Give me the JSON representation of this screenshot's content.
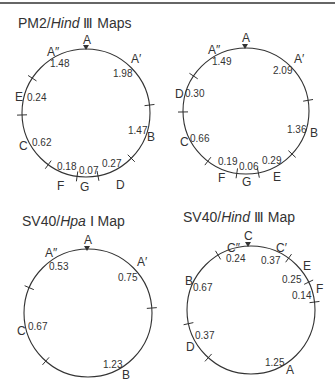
{
  "maps": [
    {
      "id": "pm2-hind3-1",
      "title_prefix": "PM2/",
      "title_enzyme": "Hind",
      "title_suffix": " Ⅲ  Maps",
      "title_pos": [
        18,
        28
      ],
      "circle": {
        "cx": 86,
        "cy": 113,
        "r": 64
      },
      "origin_marker": [
        86,
        49
      ],
      "ticks": [
        [
          32,
          78
        ],
        [
          21,
          115
        ],
        [
          150,
          105
        ],
        [
          131,
          158
        ],
        [
          48,
          165
        ],
        [
          77,
          177
        ],
        [
          98,
          176
        ]
      ],
      "fragments": [
        {
          "name": "A",
          "x": 83,
          "y": 44
        },
        {
          "name": "A″",
          "x": 47,
          "y": 56
        },
        {
          "name": "A′",
          "x": 131,
          "y": 63
        },
        {
          "name": "E",
          "x": 15,
          "y": 101
        },
        {
          "name": "C",
          "x": 19,
          "y": 150
        },
        {
          "name": "F",
          "x": 57,
          "y": 190
        },
        {
          "name": "G",
          "x": 80,
          "y": 191
        },
        {
          "name": "D",
          "x": 116,
          "y": 189
        },
        {
          "name": "B",
          "x": 147,
          "y": 141
        }
      ],
      "lengths": [
        {
          "value": "1.48",
          "x": 50,
          "y": 67
        },
        {
          "value": "1.98",
          "x": 113,
          "y": 77
        },
        {
          "value": "0.24",
          "x": 27,
          "y": 101
        },
        {
          "value": "0.62",
          "x": 32,
          "y": 146
        },
        {
          "value": "0.18",
          "x": 57,
          "y": 170
        },
        {
          "value": "0.07",
          "x": 79,
          "y": 174
        },
        {
          "value": "0.27",
          "x": 102,
          "y": 167
        },
        {
          "value": "1.47",
          "x": 128,
          "y": 134
        }
      ]
    },
    {
      "id": "pm2-hind3-2",
      "circle": {
        "cx": 246,
        "cy": 111,
        "r": 63
      },
      "origin_marker": [
        245,
        48
      ],
      "ticks": [
        [
          192,
          75
        ],
        [
          181,
          112
        ],
        [
          310,
          100
        ],
        [
          292,
          154
        ],
        [
          208,
          161
        ],
        [
          237,
          172
        ],
        [
          258,
          171
        ]
      ],
      "fragments": [
        {
          "name": "A",
          "x": 242,
          "y": 42
        },
        {
          "name": "A″",
          "x": 208,
          "y": 54
        },
        {
          "name": "A′",
          "x": 294,
          "y": 63
        },
        {
          "name": "D",
          "x": 175,
          "y": 98
        },
        {
          "name": "C",
          "x": 180,
          "y": 146
        },
        {
          "name": "F",
          "x": 218,
          "y": 182
        },
        {
          "name": "G",
          "x": 242,
          "y": 186
        },
        {
          "name": "E",
          "x": 273,
          "y": 181
        },
        {
          "name": "B",
          "x": 310,
          "y": 137
        }
      ],
      "lengths": [
        {
          "value": "1.49",
          "x": 212,
          "y": 65
        },
        {
          "value": "2.09",
          "x": 273,
          "y": 74
        },
        {
          "value": "0.30",
          "x": 185,
          "y": 97
        },
        {
          "value": "0.66",
          "x": 190,
          "y": 142
        },
        {
          "value": "0.19",
          "x": 218,
          "y": 165
        },
        {
          "value": "0.06",
          "x": 239,
          "y": 170
        },
        {
          "value": "0.29",
          "x": 262,
          "y": 164
        },
        {
          "value": "1.36",
          "x": 287,
          "y": 133
        }
      ]
    },
    {
      "id": "sv40-hpa1",
      "title_prefix": "SV40/",
      "title_enzyme": "Hpa",
      "title_suffix": " Ⅰ  Map",
      "title_pos": [
        22,
        226
      ],
      "circle": {
        "cx": 88,
        "cy": 313,
        "r": 64
      },
      "origin_marker": [
        87,
        250
      ],
      "ticks": [
        [
          30,
          288
        ],
        [
          152,
          308
        ],
        [
          45,
          362
        ]
      ],
      "fragments": [
        {
          "name": "A",
          "x": 84,
          "y": 244
        },
        {
          "name": "A″",
          "x": 45,
          "y": 257
        },
        {
          "name": "A′",
          "x": 137,
          "y": 266
        },
        {
          "name": "C",
          "x": 17,
          "y": 335
        },
        {
          "name": "B",
          "x": 122,
          "y": 379
        }
      ],
      "lengths": [
        {
          "value": "0.53",
          "x": 49,
          "y": 270
        },
        {
          "value": "0.75",
          "x": 118,
          "y": 281
        },
        {
          "value": "0.67",
          "x": 28,
          "y": 330
        },
        {
          "value": "1.23",
          "x": 103,
          "y": 368
        }
      ]
    },
    {
      "id": "sv40-hind3",
      "title_prefix": "SV40/",
      "title_enzyme": "Hind",
      "title_suffix": " Ⅲ  Map",
      "title_pos": [
        183,
        222
      ],
      "circle": {
        "cx": 251,
        "cy": 310,
        "r": 64
      },
      "origin_marker": [
        248,
        246
      ],
      "ticks": [
        [
          218,
          255
        ],
        [
          288,
          259
        ],
        [
          309,
          282
        ],
        [
          315,
          302
        ],
        [
          187,
          324
        ],
        [
          208,
          358
        ]
      ],
      "fragments": [
        {
          "name": "C",
          "x": 244,
          "y": 240
        },
        {
          "name": "C″",
          "x": 227,
          "y": 252
        },
        {
          "name": "C′",
          "x": 276,
          "y": 252
        },
        {
          "name": "E",
          "x": 303,
          "y": 270
        },
        {
          "name": "F",
          "x": 316,
          "y": 293
        },
        {
          "name": "B",
          "x": 185,
          "y": 285
        },
        {
          "name": "D",
          "x": 186,
          "y": 351
        },
        {
          "name": "A",
          "x": 286,
          "y": 374
        }
      ],
      "lengths": [
        {
          "value": "0.24",
          "x": 226,
          "y": 262
        },
        {
          "value": "0.37",
          "x": 261,
          "y": 264
        },
        {
          "value": "0.25",
          "x": 282,
          "y": 283
        },
        {
          "value": "0.14",
          "x": 292,
          "y": 299
        },
        {
          "value": "0.67",
          "x": 193,
          "y": 291
        },
        {
          "value": "0.37",
          "x": 195,
          "y": 339
        },
        {
          "value": "1.25",
          "x": 265,
          "y": 366
        }
      ]
    }
  ]
}
